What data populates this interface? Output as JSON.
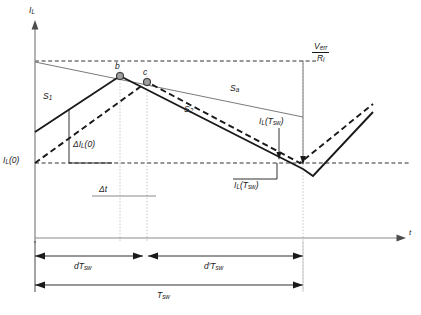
{
  "figure": {
    "axes": {
      "y_label": "I",
      "y_label_sub": "L",
      "x_label": "t"
    },
    "labels": {
      "s1": "S",
      "s1_sub": "1",
      "s2": "S",
      "s2_sub": "2",
      "sa": "S",
      "sa_sub": "a",
      "point_b": "b",
      "point_c": "c",
      "delta_il0": "ΔI",
      "delta_il0_sub": "L",
      "delta_il0_tail": "(0)",
      "il0": "I",
      "il0_sub": "L",
      "il0_tail": "(0)",
      "delta_t": "Δt",
      "il_tsw_upper": "I",
      "il_tsw_upper_sub": "L",
      "il_tsw_upper_tail": "(T",
      "il_tsw_upper_sub2": "sw",
      "il_tsw_upper_tail2": ")",
      "il_tsw_lower": "I",
      "il_tsw_lower_sub": "L",
      "il_tsw_lower_tail": "(T",
      "il_tsw_lower_sub2": "sw",
      "il_tsw_lower_tail2": ")",
      "verr_num": "V",
      "verr_num_sub": "err",
      "verr_den": "R",
      "verr_den_sub": "i",
      "dtsw": "dT",
      "dtsw_sub": "sw",
      "dptsw": "d′T",
      "dptsw_sub": "sw",
      "tsw": "T",
      "tsw_sub": "sw"
    },
    "colors": {
      "waveform": "#1a1a1a",
      "axis": "#808080",
      "dashed_guide": "#1a1a1a",
      "ramp": "#4d4d4d",
      "marker_fill": "#9e9e9e",
      "marker_stroke": "#3a3a3a",
      "dotted_vertical": "#b0b0b0",
      "dimension": "#1a1a1a"
    },
    "geometry": {
      "origin_x": 35,
      "origin_y": 238,
      "top_dashed_y": 61,
      "bottom_dashed_y": 163,
      "b_x": 120,
      "b_y": 76,
      "c_x": 147,
      "c_y": 82,
      "period_end_x": 303,
      "t_axis_end_x": 405
    }
  }
}
